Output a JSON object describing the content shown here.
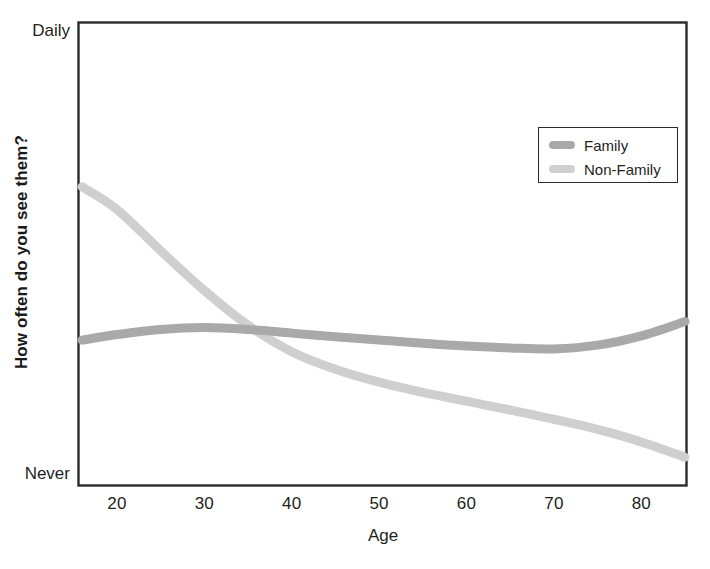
{
  "chart_data": {
    "type": "line",
    "title": "",
    "subtitle": "",
    "xlabel": "Age",
    "ylabel": "How often do you see them?",
    "xlim": [
      16,
      85
    ],
    "ylim": [
      0,
      100
    ],
    "grid": false,
    "legend_position": "top-right",
    "x_tick_labels": [
      "20",
      "30",
      "40",
      "50",
      "60",
      "70",
      "80"
    ],
    "x_ticks": [
      20,
      30,
      40,
      50,
      60,
      70,
      80
    ],
    "y_tick_labels": [
      "Never",
      "Daily"
    ],
    "y_ticks": [
      0,
      100
    ],
    "annotations": [],
    "series": [
      {
        "name": "Family",
        "color": "#a9a9a9",
        "x": [
          16,
          20,
          25,
          30,
          35,
          40,
          45,
          50,
          55,
          60,
          65,
          70,
          75,
          80,
          85
        ],
        "values": [
          31.3,
          32.5,
          33.6,
          34.0,
          33.6,
          32.8,
          32.0,
          31.3,
          30.6,
          30.0,
          29.6,
          29.4,
          30.2,
          32.2,
          35.3
        ]
      },
      {
        "name": "Non-Family",
        "color": "#cfcfcf",
        "x": [
          16,
          20,
          25,
          30,
          35,
          40,
          45,
          50,
          55,
          60,
          65,
          70,
          75,
          80,
          85
        ],
        "values": [
          64.4,
          59.5,
          50.6,
          42.0,
          34.5,
          28.8,
          25.0,
          22.2,
          20.0,
          18.1,
          16.2,
          14.2,
          12.0,
          9.3,
          6.0
        ]
      }
    ],
    "crossing_point": {
      "x": 35,
      "note": "Family and Non-Family curves intersect near age 35"
    }
  },
  "legend": {
    "items": [
      {
        "label": "Family",
        "color": "#a9a9a9"
      },
      {
        "label": "Non-Family",
        "color": "#cfcfcf"
      }
    ]
  },
  "axes": {
    "y_top_label": "Daily",
    "y_bottom_label": "Never",
    "y_axis_title": "How often do you see them?",
    "x_axis_title": "Age"
  }
}
